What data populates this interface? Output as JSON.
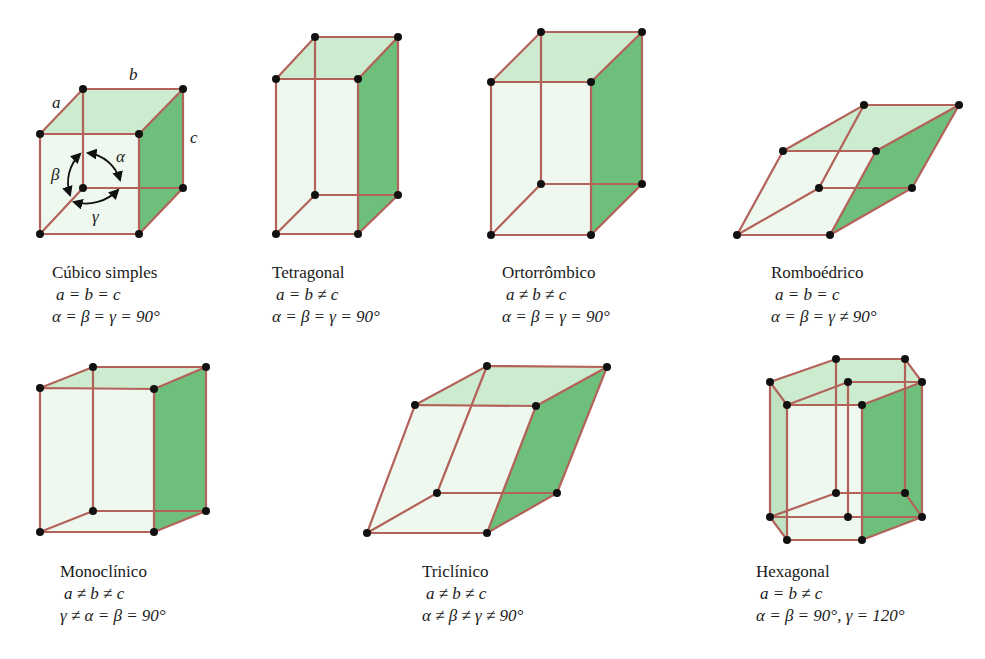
{
  "colors": {
    "edge": "#b3625a",
    "vertex": "#111111",
    "face_shaded": "#6dbf7b",
    "face_top": "#cdebcf",
    "face_front": "#eef8ee"
  },
  "axis_labels": {
    "a": "a",
    "b": "b",
    "c": "c",
    "alpha": "α",
    "beta": "β",
    "gamma": "γ"
  },
  "systems": [
    {
      "name": "Cúbico simples",
      "lengths": "a = b = c",
      "angles": "α = β = γ = 90°"
    },
    {
      "name": "Tetragonal",
      "lengths": "a = b ≠ c",
      "angles": "α = β = γ = 90°"
    },
    {
      "name": "Ortorrômbico",
      "lengths": "a ≠ b ≠ c",
      "angles": "α = β = γ = 90°"
    },
    {
      "name": "Romboédrico",
      "lengths": "a = b = c",
      "angles": "α = β = γ ≠ 90°"
    },
    {
      "name": "Monoclínico",
      "lengths": "a ≠ b ≠ c",
      "angles": "γ ≠ α = β = 90°"
    },
    {
      "name": "Triclínico",
      "lengths": "a ≠ b ≠ c",
      "angles": "α ≠ β ≠ γ ≠ 90°"
    },
    {
      "name": "Hexagonal",
      "lengths": "a = b ≠ c",
      "angles": "α = β = 90°, γ = 120°"
    }
  ]
}
